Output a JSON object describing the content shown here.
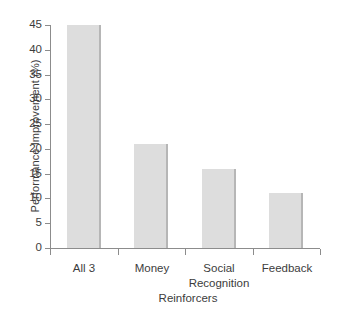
{
  "chart_data": {
    "type": "bar",
    "title": "",
    "xlabel": "Reinforcers",
    "ylabel": "Performance Improvement (%)",
    "categories": [
      "All 3",
      "Money",
      "Social Recognition",
      "Feedback"
    ],
    "values": [
      45,
      21,
      16,
      11
    ],
    "ylim": [
      0,
      45
    ],
    "ytick_step": 5,
    "ytick_labels": [
      "0",
      "5",
      "10",
      "15",
      "20",
      "25",
      "30",
      "35",
      "40",
      "45"
    ],
    "grid": false,
    "legend": null,
    "series": [
      {
        "name": "Performance Improvement",
        "values": [
          45,
          21,
          16,
          11
        ]
      }
    ],
    "colors": {
      "bar_fill": "#dddddd",
      "bar_edge_shadow": "#b6b6b6",
      "axis": "#8c8c8c",
      "text": "#3c3c3c",
      "background": "#ffffff"
    }
  },
  "axis": {
    "y_title": "Performance Improvement (%)",
    "x_title": "Reinforcers"
  },
  "categories_display": [
    {
      "line1": "All 3",
      "line2": ""
    },
    {
      "line1": "Money",
      "line2": ""
    },
    {
      "line1": "Social",
      "line2": "Recognition"
    },
    {
      "line1": "Feedback",
      "line2": ""
    }
  ]
}
